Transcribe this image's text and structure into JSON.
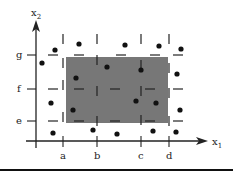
{
  "diagram": {
    "axes": {
      "x_label": "x",
      "x_sub": "1",
      "y_label": "x",
      "y_sub": "2"
    },
    "x_ticks": [
      {
        "label": "a",
        "x": 63
      },
      {
        "label": "b",
        "x": 97
      },
      {
        "label": "c",
        "x": 141
      },
      {
        "label": "d",
        "x": 169
      }
    ],
    "y_ticks": [
      {
        "label": "g",
        "y": 55
      },
      {
        "label": "f",
        "y": 89
      },
      {
        "label": "e",
        "y": 121
      }
    ],
    "shaded_region": {
      "x1": 66,
      "x2": 168,
      "y1": 57,
      "y2": 123,
      "color": "#777777"
    },
    "points": [
      [
        41,
        67
      ],
      [
        55,
        50
      ],
      [
        79,
        44
      ],
      [
        126,
        44
      ],
      [
        159,
        46
      ],
      [
        182,
        48
      ],
      [
        52,
        104
      ],
      [
        49,
        130
      ],
      [
        72,
        112
      ],
      [
        76,
        78
      ],
      [
        122,
        64
      ],
      [
        176,
        73
      ],
      [
        136,
        101
      ],
      [
        156,
        97
      ],
      [
        180,
        109
      ],
      [
        53,
        133
      ],
      [
        93,
        130
      ],
      [
        117,
        133
      ],
      [
        153,
        131
      ],
      [
        176,
        132
      ],
      [
        175,
        128
      ]
    ]
  }
}
